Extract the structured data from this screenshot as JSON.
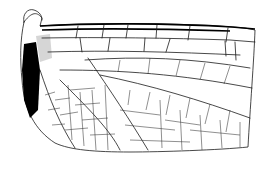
{
  "figure": {
    "style": "black ink line drawing on white",
    "colors": {
      "background": "#ffffff",
      "ink": "#000000"
    }
  }
}
